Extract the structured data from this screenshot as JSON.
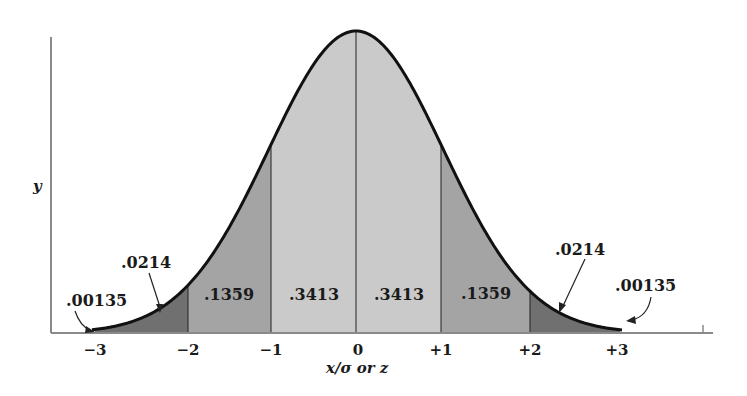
{
  "figure": {
    "y_axis_label": "y",
    "x_axis_label": "x/σ or z",
    "colors": {
      "center_band": "#cacaca",
      "middle_band": "#a4a4a4",
      "tail_band": "#707070",
      "curve": "#111111",
      "axis": "#8a8a8a"
    }
  },
  "ticks": [
    "−3",
    "−2",
    "−1",
    "0",
    "+1",
    "+2",
    "+3"
  ],
  "regions": {
    "left_far_tail": ".00135",
    "left_tail": ".0214",
    "left_middle": ".1359",
    "left_center": ".3413",
    "right_center": ".3413",
    "right_middle": ".1359",
    "right_tail": ".0214",
    "right_far_tail": ".00135"
  },
  "chart_data": {
    "type": "area",
    "xlabel": "x/σ or z",
    "ylabel": "y",
    "x_ticks": [
      -3,
      -2,
      -1,
      0,
      1,
      2,
      3
    ],
    "regions": [
      {
        "from": "-inf",
        "to": -3,
        "area": 0.00135
      },
      {
        "from": -3,
        "to": -2,
        "area": 0.0214
      },
      {
        "from": -2,
        "to": -1,
        "area": 0.1359
      },
      {
        "from": -1,
        "to": 0,
        "area": 0.3413
      },
      {
        "from": 0,
        "to": 1,
        "area": 0.3413
      },
      {
        "from": 1,
        "to": 2,
        "area": 0.1359
      },
      {
        "from": 2,
        "to": 3,
        "area": 0.0214
      },
      {
        "from": 3,
        "to": "inf",
        "area": 0.00135
      }
    ],
    "grid": false
  }
}
